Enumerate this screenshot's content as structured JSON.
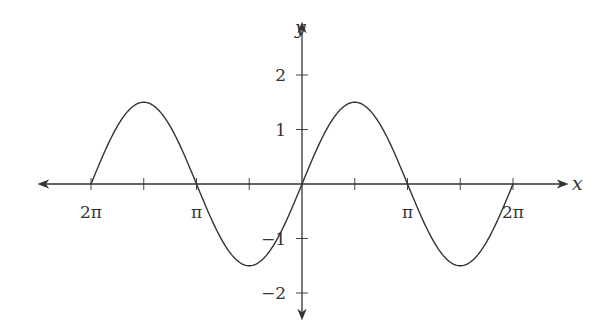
{
  "chart_data": {
    "type": "line",
    "title": "",
    "function": "y = 1.5 sin(x)",
    "xlabel": "x",
    "ylabel": "y",
    "xlim": [
      -6.2832,
      6.2832
    ],
    "ylim": [
      -2,
      2
    ],
    "grid": false,
    "legend": null,
    "x_ticks": [
      {
        "value": -6.2832,
        "label": "2π"
      },
      {
        "value": -4.7124,
        "label": ""
      },
      {
        "value": -3.1416,
        "label": "π"
      },
      {
        "value": -1.5708,
        "label": ""
      },
      {
        "value": 1.5708,
        "label": ""
      },
      {
        "value": 3.1416,
        "label": "π"
      },
      {
        "value": 4.7124,
        "label": ""
      },
      {
        "value": 6.2832,
        "label": "2π"
      }
    ],
    "y_ticks": [
      {
        "value": 2,
        "label": "2"
      },
      {
        "value": 1,
        "label": "1"
      },
      {
        "value": -1,
        "label": "−1"
      },
      {
        "value": -2,
        "label": "−2"
      }
    ],
    "series": [
      {
        "name": "1.5 sin(x)",
        "amplitude": 1.5,
        "x": [
          -6.2832,
          -4.7124,
          -3.1416,
          -1.5708,
          0,
          1.5708,
          3.1416,
          4.7124,
          6.2832
        ],
        "values": [
          0,
          1.5,
          0,
          -1.5,
          0,
          1.5,
          0,
          -1.5,
          0
        ]
      }
    ]
  },
  "layout": {
    "origin_px": [
      302,
      184
    ],
    "x_unit_px_per_pi": 105.5,
    "y_unit_px": 54.5,
    "x_axis_px": [
      38,
      566
    ],
    "y_axis_px": [
      22,
      318
    ],
    "line_color": "#333333"
  }
}
